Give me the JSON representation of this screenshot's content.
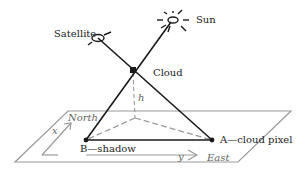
{
  "diagram": {
    "labels": {
      "satellite": "Satellite",
      "sun": "Sun",
      "cloud": "Cloud",
      "height": "h",
      "north": "North",
      "east": "East",
      "x_axis": "x",
      "y_axis": "y",
      "point_a": "A—cloud pixel",
      "point_b": "B—shadow"
    },
    "colors": {
      "ray": "#1a1a1a",
      "plane": "#9a9a9a",
      "text": "#222222"
    }
  }
}
